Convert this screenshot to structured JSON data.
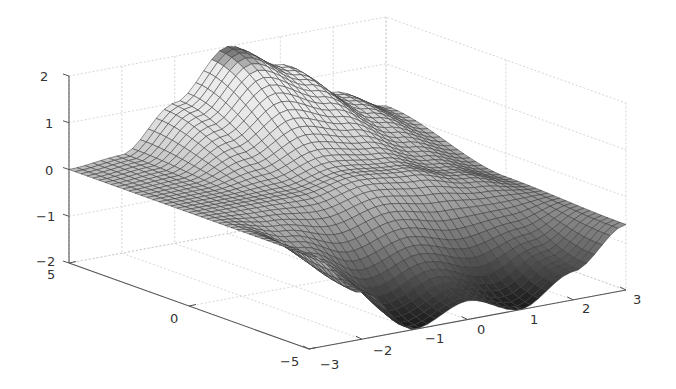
{
  "chart_data": {
    "type": "surface",
    "title": "",
    "xlabel": "",
    "ylabel": "",
    "zlabel": "",
    "colormap": "gray",
    "grid": true,
    "xlim": [
      -3,
      3
    ],
    "ylim": [
      -5,
      5
    ],
    "zlim": [
      -2,
      2
    ],
    "x_ticks": [
      "-3",
      "-2",
      "-1",
      "0",
      "1",
      "2",
      "3"
    ],
    "y_ticks": [
      "-5",
      "0",
      "5"
    ],
    "z_ticks": [
      "-2",
      "-1",
      "0",
      "1",
      "2"
    ],
    "x_tick_values": [
      -3,
      -2,
      -1,
      0,
      1,
      2,
      3
    ],
    "y_tick_values": [
      -5,
      0,
      5
    ],
    "z_tick_values": [
      -2,
      -1,
      0,
      1,
      2
    ],
    "grid_size": {
      "nx": 41,
      "ny": 41
    },
    "profile_samples": {
      "x": [
        -3,
        -2,
        -1,
        0,
        1,
        2,
        3
      ],
      "z_at_y_5": [
        0,
        0.1,
        1.0,
        2.0,
        1.4,
        0.6,
        0.1
      ],
      "z_at_y_0": [
        0,
        0,
        0,
        0.2,
        0.1,
        -0.2,
        -0.5
      ],
      "z_at_y_minus_5": [
        0,
        -1.0,
        -2.0,
        -1.6,
        -2.0,
        -1.4,
        -0.6
      ]
    }
  },
  "axes": {
    "z_tick_labels": [
      "-2",
      "-1",
      "0",
      "1",
      "2"
    ],
    "y_tick_labels": [
      "5",
      "0",
      "-5"
    ],
    "x_tick_labels": [
      "-3",
      "-2",
      "-1",
      "0",
      "1",
      "2",
      "3"
    ]
  },
  "colors": {
    "axis": "#555555",
    "grid": "#cccccc",
    "mesh_edge": "#333333",
    "background": "#ffffff"
  }
}
